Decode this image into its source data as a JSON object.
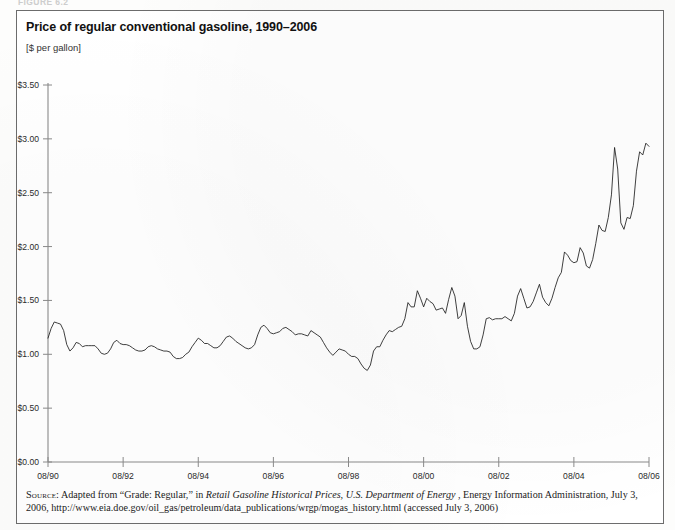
{
  "figure_caption": "FIGURE 6.2",
  "chart_title": "Price of regular conventional gasoline, 1990–2006",
  "chart_units": "[$ per gallon]",
  "source": {
    "kicker": "Source:",
    "line1_a": "Adapted from “Grade: Regular,” in ",
    "line1_italic_1": "Retail Gasoline Historical Prices, U.S. Department of Energy",
    "line1_b": ", Energy Information Administration, July 3,",
    "line2": "2006, http://www.eia.doe.gov/oil_gas/petroleum/data_publications/wrgp/mogas_history.html (accessed July 3, 2006)"
  },
  "axis": {
    "y_ticks": [
      "$0.00",
      "$0.50",
      "$1.00",
      "$1.50",
      "$2.00",
      "$2.50",
      "$3.00",
      "$3.50"
    ],
    "x_ticks": [
      "08/90",
      "08/92",
      "08/94",
      "08/96",
      "08/98",
      "08/00",
      "08/02",
      "08/04",
      "08/06"
    ],
    "line_color": "#1d1d1d",
    "axis_color": "#8a8a8a"
  },
  "chart_data": {
    "type": "line",
    "title": "Price of regular conventional gasoline, 1990–2006",
    "subtitle": "[$ per gallon]",
    "xlabel": "",
    "ylabel": "$ per gallon",
    "ylim": [
      0.0,
      3.5
    ],
    "ytick_values": [
      0.0,
      0.5,
      1.0,
      1.5,
      2.0,
      2.5,
      3.0,
      3.5
    ],
    "xtick_labels": [
      "08/90",
      "08/92",
      "08/94",
      "08/96",
      "08/98",
      "08/00",
      "08/02",
      "08/04",
      "08/06"
    ],
    "xtick_x": [
      "1990-08",
      "1992-08",
      "1994-08",
      "1996-08",
      "1998-08",
      "2000-08",
      "2002-08",
      "2004-08",
      "2006-08"
    ],
    "grid": false,
    "legend": false,
    "x_start": "1990-08",
    "x_end": "2006-08",
    "x_interval": "monthly",
    "series": [
      {
        "name": "Regular conventional gasoline, retail price",
        "unit": "$ per gallon",
        "x": [
          "1990-08",
          "1990-09",
          "1990-10",
          "1990-11",
          "1990-12",
          "1991-01",
          "1991-02",
          "1991-03",
          "1991-04",
          "1991-05",
          "1991-06",
          "1991-07",
          "1991-08",
          "1991-09",
          "1991-10",
          "1991-11",
          "1991-12",
          "1992-01",
          "1992-02",
          "1992-03",
          "1992-04",
          "1992-05",
          "1992-06",
          "1992-07",
          "1992-08",
          "1992-09",
          "1992-10",
          "1992-11",
          "1992-12",
          "1993-01",
          "1993-02",
          "1993-03",
          "1993-04",
          "1993-05",
          "1993-06",
          "1993-07",
          "1993-08",
          "1993-09",
          "1993-10",
          "1993-11",
          "1993-12",
          "1994-01",
          "1994-02",
          "1994-03",
          "1994-04",
          "1994-05",
          "1994-06",
          "1994-07",
          "1994-08",
          "1994-09",
          "1994-10",
          "1994-11",
          "1994-12",
          "1995-01",
          "1995-02",
          "1995-03",
          "1995-04",
          "1995-05",
          "1995-06",
          "1995-07",
          "1995-08",
          "1995-09",
          "1995-10",
          "1995-11",
          "1995-12",
          "1996-01",
          "1996-02",
          "1996-03",
          "1996-04",
          "1996-05",
          "1996-06",
          "1996-07",
          "1996-08",
          "1996-09",
          "1996-10",
          "1996-11",
          "1996-12",
          "1997-01",
          "1997-02",
          "1997-03",
          "1997-04",
          "1997-05",
          "1997-06",
          "1997-07",
          "1997-08",
          "1997-09",
          "1997-10",
          "1997-11",
          "1997-12",
          "1998-01",
          "1998-02",
          "1998-03",
          "1998-04",
          "1998-05",
          "1998-06",
          "1998-07",
          "1998-08",
          "1998-09",
          "1998-10",
          "1998-11",
          "1998-12",
          "1999-01",
          "1999-02",
          "1999-03",
          "1999-04",
          "1999-05",
          "1999-06",
          "1999-07",
          "1999-08",
          "1999-09",
          "1999-10",
          "1999-11",
          "1999-12",
          "2000-01",
          "2000-02",
          "2000-03",
          "2000-04",
          "2000-05",
          "2000-06",
          "2000-07",
          "2000-08",
          "2000-09",
          "2000-10",
          "2000-11",
          "2000-12",
          "2001-01",
          "2001-02",
          "2001-03",
          "2001-04",
          "2001-05",
          "2001-06",
          "2001-07",
          "2001-08",
          "2001-09",
          "2001-10",
          "2001-11",
          "2001-12",
          "2002-01",
          "2002-02",
          "2002-03",
          "2002-04",
          "2002-05",
          "2002-06",
          "2002-07",
          "2002-08",
          "2002-09",
          "2002-10",
          "2002-11",
          "2002-12",
          "2003-01",
          "2003-02",
          "2003-03",
          "2003-04",
          "2003-05",
          "2003-06",
          "2003-07",
          "2003-08",
          "2003-09",
          "2003-10",
          "2003-11",
          "2003-12",
          "2004-01",
          "2004-02",
          "2004-03",
          "2004-04",
          "2004-05",
          "2004-06",
          "2004-07",
          "2004-08",
          "2004-09",
          "2004-10",
          "2004-11",
          "2004-12",
          "2005-01",
          "2005-02",
          "2005-03",
          "2005-04",
          "2005-05",
          "2005-06",
          "2005-07",
          "2005-08",
          "2005-09",
          "2005-10",
          "2005-11",
          "2005-12",
          "2006-01",
          "2006-02",
          "2006-03",
          "2006-04",
          "2006-05",
          "2006-06",
          "2006-07",
          "2006-08"
        ],
        "values": [
          1.15,
          1.24,
          1.3,
          1.29,
          1.28,
          1.22,
          1.09,
          1.03,
          1.06,
          1.11,
          1.1,
          1.07,
          1.08,
          1.08,
          1.08,
          1.08,
          1.05,
          1.01,
          1.0,
          1.01,
          1.05,
          1.11,
          1.13,
          1.1,
          1.09,
          1.09,
          1.08,
          1.06,
          1.04,
          1.03,
          1.03,
          1.04,
          1.07,
          1.08,
          1.07,
          1.05,
          1.04,
          1.03,
          1.03,
          1.02,
          0.98,
          0.96,
          0.96,
          0.97,
          1.0,
          1.02,
          1.07,
          1.11,
          1.15,
          1.13,
          1.1,
          1.1,
          1.08,
          1.06,
          1.06,
          1.08,
          1.12,
          1.16,
          1.17,
          1.15,
          1.12,
          1.1,
          1.08,
          1.06,
          1.05,
          1.06,
          1.09,
          1.18,
          1.25,
          1.27,
          1.24,
          1.2,
          1.19,
          1.2,
          1.21,
          1.24,
          1.25,
          1.23,
          1.21,
          1.18,
          1.19,
          1.19,
          1.18,
          1.17,
          1.22,
          1.2,
          1.18,
          1.16,
          1.11,
          1.06,
          1.02,
          0.99,
          1.02,
          1.05,
          1.04,
          1.03,
          1.0,
          0.98,
          0.98,
          0.96,
          0.91,
          0.87,
          0.85,
          0.9,
          1.03,
          1.07,
          1.07,
          1.13,
          1.18,
          1.22,
          1.21,
          1.23,
          1.25,
          1.26,
          1.33,
          1.48,
          1.44,
          1.44,
          1.59,
          1.52,
          1.44,
          1.52,
          1.49,
          1.47,
          1.41,
          1.42,
          1.43,
          1.38,
          1.51,
          1.62,
          1.54,
          1.33,
          1.36,
          1.48,
          1.26,
          1.12,
          1.05,
          1.05,
          1.07,
          1.18,
          1.33,
          1.34,
          1.32,
          1.33,
          1.33,
          1.33,
          1.35,
          1.33,
          1.31,
          1.38,
          1.54,
          1.61,
          1.52,
          1.43,
          1.44,
          1.49,
          1.57,
          1.65,
          1.53,
          1.48,
          1.45,
          1.52,
          1.62,
          1.71,
          1.76,
          1.95,
          1.92,
          1.87,
          1.85,
          1.86,
          1.99,
          1.94,
          1.82,
          1.8,
          1.88,
          2.03,
          2.2,
          2.15,
          2.14,
          2.27,
          2.48,
          2.92,
          2.72,
          2.22,
          2.16,
          2.27,
          2.26,
          2.38,
          2.7,
          2.88,
          2.85,
          2.96,
          2.93
        ]
      }
    ],
    "annotations": [
      {
        "label": "1990 Gulf War peak",
        "x": "1990-10",
        "y": 1.3
      },
      {
        "label": "1999 low",
        "x": "1999-02",
        "y": 0.85
      },
      {
        "label": "Post-9/11 low",
        "x": "2001-12",
        "y": 1.05
      },
      {
        "label": "Hurricane Katrina peak",
        "x": "2005-09",
        "y": 2.92
      },
      {
        "label": "Series end",
        "x": "2006-08",
        "y": 2.93
      }
    ]
  }
}
